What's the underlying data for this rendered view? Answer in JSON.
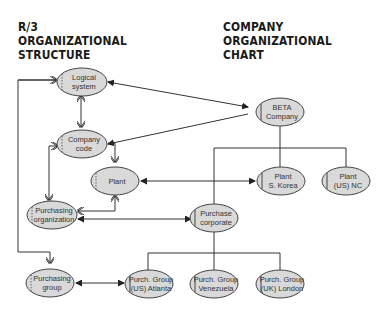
{
  "headings": {
    "left": [
      "R/3",
      "ORGANIZATIONAL",
      "STRUCTURE"
    ],
    "right": [
      "COMPANY",
      "ORGANIZATIONAL",
      "CHART"
    ]
  },
  "colors": {
    "node_fill": "#d9d9d9",
    "node_stroke": "#444444",
    "line": "#333333",
    "text": "#1a1a1a"
  },
  "nodes": {
    "logical_system": [
      "Logical",
      "system"
    ],
    "company_code": [
      "Company",
      "code"
    ],
    "plant": [
      "Plant"
    ],
    "purchasing_org": [
      "Purchasing",
      "organization"
    ],
    "purchasing_group": [
      "Purchasing",
      "group"
    ],
    "beta_company": [
      "BETA",
      "Company"
    ],
    "plant_korea": [
      "Plant",
      "S. Korea"
    ],
    "plant_nc": [
      "Plant",
      "(US) NC"
    ],
    "purchase_corporate": [
      "Purchase",
      "corporate"
    ],
    "pg_atlanta": [
      "Purch. Group",
      "(US) Atlanta"
    ],
    "pg_venezuela": [
      "Purch. Group",
      "Venezuela"
    ],
    "pg_london": [
      "Purch. Group",
      "(UK) London"
    ]
  }
}
